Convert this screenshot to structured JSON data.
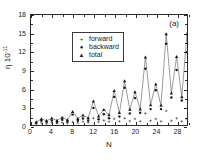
{
  "figure": {
    "panel_label": "(a)",
    "background_color": "#ffffff",
    "axis_color": "#2b2b2b"
  },
  "legend": {
    "position": "top-left",
    "entries": [
      {
        "label": "forward",
        "marker": "plus-marker",
        "glyph": "+"
      },
      {
        "label": "backward",
        "marker": "dot-marker",
        "glyph": "●"
      },
      {
        "label": "total",
        "marker": "triangle-marker",
        "glyph": "▲"
      }
    ]
  },
  "chart_data": {
    "type": "scatter",
    "title": "",
    "subtitle": "",
    "panel": "(a)",
    "xlabel": "N",
    "ylabel": "η 10",
    "ylabel_exponent": "-11",
    "xlim": [
      0,
      30
    ],
    "ylim": [
      0,
      18
    ],
    "xticks": [
      0,
      4,
      8,
      12,
      16,
      20,
      24,
      28
    ],
    "yticks": [
      0,
      3,
      6,
      9,
      12,
      15,
      18
    ],
    "xtick_labels": [
      "0",
      "4",
      "8",
      "12",
      "16",
      "20",
      "24",
      "28"
    ],
    "ytick_labels": [
      "0",
      "3",
      "6",
      "9",
      "12",
      "15",
      "18"
    ],
    "xminor_step": 2,
    "yminor_step": 1.5,
    "grid": false,
    "legend_position": "upper left",
    "x": [
      1,
      2,
      3,
      4,
      5,
      6,
      7,
      8,
      9,
      10,
      11,
      12,
      13,
      14,
      15,
      16,
      17,
      18,
      19,
      20,
      21,
      22,
      23,
      24,
      25,
      26,
      27,
      28,
      29,
      30
    ],
    "series": [
      {
        "name": "forward",
        "marker": "plus-marker",
        "connected": false,
        "values": [
          0.15,
          0.3,
          0.2,
          0.35,
          0.25,
          0.4,
          0.3,
          0.5,
          0.35,
          0.55,
          0.4,
          1.1,
          0.5,
          0.75,
          0.55,
          1.0,
          0.6,
          1.1,
          0.65,
          1.0,
          0.6,
          1.9,
          0.7,
          1.0,
          0.6,
          2.3,
          0.7,
          1.1,
          0.6,
          1.0
        ]
      },
      {
        "name": "backward",
        "marker": "dot-marker",
        "connected": false,
        "values": [
          0.35,
          0.7,
          0.5,
          0.75,
          0.5,
          0.85,
          0.55,
          1.7,
          0.7,
          1.05,
          0.75,
          2.8,
          0.95,
          1.75,
          1.1,
          4.6,
          1.4,
          6.1,
          1.9,
          4.4,
          2.0,
          9.2,
          2.6,
          5.7,
          2.6,
          13.3,
          4.5,
          9.0,
          4.0,
          11.9
        ]
      },
      {
        "name": "total",
        "marker": "triangle-marker",
        "connected": true,
        "values": [
          0.5,
          1.0,
          0.7,
          1.1,
          0.75,
          1.25,
          0.85,
          2.2,
          1.05,
          1.6,
          1.15,
          3.9,
          1.45,
          2.5,
          1.65,
          5.6,
          2.0,
          7.2,
          2.55,
          5.4,
          2.6,
          11.1,
          3.3,
          6.7,
          3.2,
          14.9,
          5.2,
          11.2,
          4.6,
          14.9
        ]
      }
    ]
  }
}
